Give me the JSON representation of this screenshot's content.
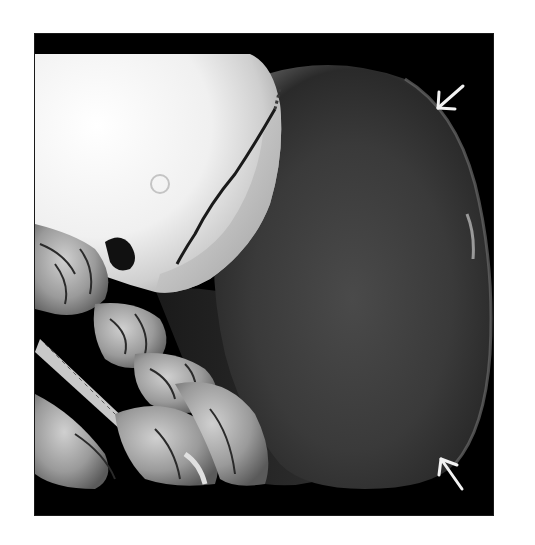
{
  "figure": {
    "type": "3D CT volume rendering",
    "background_color": "#000000",
    "page_background": "#ffffff",
    "annotations": [
      {
        "kind": "arrow",
        "color": "#f2f2f2",
        "direction": "pointing down-left",
        "target": "upper margin of mass"
      },
      {
        "kind": "arrow",
        "color": "#f2f2f2",
        "direction": "pointing up-left",
        "target": "lower margin of mass"
      }
    ],
    "structures": {
      "skull": {
        "tone": "#e8e8e8"
      },
      "mass": {
        "tone": "#3a3a3a"
      },
      "spine_and_shoulder": {
        "tone": "#9a9a9a"
      }
    }
  }
}
